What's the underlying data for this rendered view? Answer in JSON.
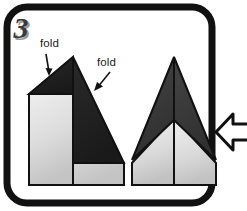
{
  "panel": {
    "step_number": "3",
    "frame_color": "#111111",
    "background_color": "#ffffff"
  },
  "labels": {
    "fold_left": "fold",
    "fold_right": "fold"
  },
  "icons": {
    "arrow_down": "arrow-down-icon",
    "arrow_down_left": "arrow-down-left-icon",
    "next_step": "arrow-left-icon"
  },
  "colors": {
    "outline": "#111111",
    "dark_flap": "#222222",
    "mid_flap": "#3c3c3c",
    "paper_light_top": "#e8e8e8",
    "paper_light_bottom": "#c9c9c9",
    "numeral_fill": "#3a3a3a",
    "numeral_shadow": "#9a9a9a"
  },
  "diagrams": {
    "left": {
      "name": "partially-folded-plane",
      "description": "Rectangular paper body with two dark triangular folded flaps meeting at a top apex"
    },
    "right": {
      "name": "folded-dart-plane",
      "description": "Symmetric dart shape with two dark wings and light lower body split by a center crease"
    }
  }
}
